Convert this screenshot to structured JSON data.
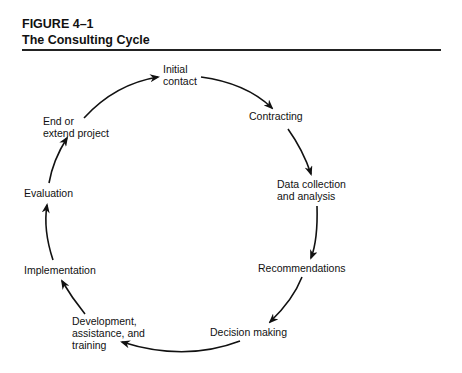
{
  "figure": {
    "label": "FIGURE 4–1",
    "title": "The Consulting Cycle"
  },
  "cycle": {
    "stages": [
      {
        "id": "initial-contact",
        "line1": "Initial",
        "line2": "contact"
      },
      {
        "id": "contracting",
        "line1": "Contracting"
      },
      {
        "id": "data-collection",
        "line1": "Data collection",
        "line2": "and analysis"
      },
      {
        "id": "recommendations",
        "line1": "Recommendations"
      },
      {
        "id": "decision-making",
        "line1": "Decision making"
      },
      {
        "id": "development",
        "line1": "Development,",
        "line2": "assistance, and",
        "line3": "training"
      },
      {
        "id": "implementation",
        "line1": "Implementation"
      },
      {
        "id": "evaluation",
        "line1": "Evaluation"
      },
      {
        "id": "end-extend",
        "line1": "End or",
        "line2": "extend project"
      }
    ],
    "flow": "clockwise",
    "arrow_color": "#111111"
  }
}
